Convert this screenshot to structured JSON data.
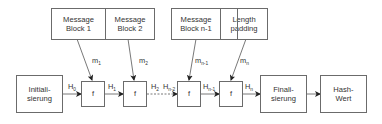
{
  "diagram": {
    "type": "merkle-damgard-hash-construction",
    "message_blocks": [
      {
        "id": "block1",
        "label": "Message\nBlock 1"
      },
      {
        "id": "block2",
        "label": "Message\nBlock 2"
      },
      {
        "id": "blockn1",
        "label": "Message\nBlock n-1"
      },
      {
        "id": "padding",
        "label": "Length\npadding"
      }
    ],
    "message_labels": {
      "m1": {
        "base": "m",
        "sub": "1"
      },
      "m2": {
        "base": "m",
        "sub": "2"
      },
      "mn1": {
        "base": "m",
        "sub": "n-1"
      },
      "mn": {
        "base": "m",
        "sub": "n"
      }
    },
    "init_box": {
      "label": "Initiali-\nsierung"
    },
    "compression_function": {
      "label": "f"
    },
    "final_box": {
      "label": "Finali-\nsierung"
    },
    "hash_box": {
      "label": "Hash-\nWert"
    },
    "chain_labels": {
      "h0": {
        "base": "H",
        "sub": "0"
      },
      "h1": {
        "base": "H",
        "sub": "1"
      },
      "h2": {
        "base": "H",
        "sub": "2"
      },
      "hn2": {
        "base": "H",
        "sub": "n-2"
      },
      "hn1": {
        "base": "H",
        "sub": "n-1"
      },
      "hn": {
        "base": "H",
        "sub": "n"
      }
    },
    "colors": {
      "stroke": "#6b6b6b",
      "arrow": "#222222",
      "text": "#333333"
    }
  }
}
